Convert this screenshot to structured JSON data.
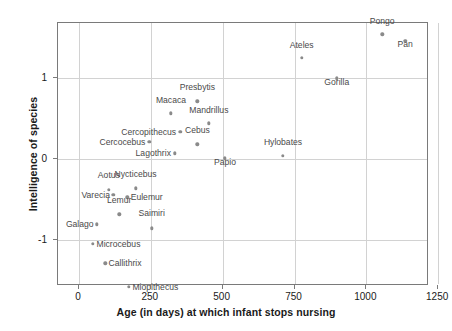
{
  "chart_data": {
    "type": "scatter",
    "title": "",
    "xlabel": "Age (in days) at which infant stops nursing",
    "ylabel": "Intelligence of species",
    "xlim": [
      -73,
      1218
    ],
    "ylim": [
      -1.56,
      1.67
    ],
    "xticks": [
      0,
      250,
      500,
      750,
      1000,
      1250
    ],
    "xticklabels": [
      "0",
      "250",
      "500",
      "750",
      "1000",
      "1250"
    ],
    "yticks": [
      -1,
      0,
      1
    ],
    "yticklabels": [
      "-1",
      "0",
      "1"
    ],
    "grid": true,
    "legend": "none",
    "point_color": "#8a8a8a",
    "label_color": "#4a4a4a",
    "grid_color": "#d2d2d2",
    "axis_color": "#7a7a7a",
    "points": [
      {
        "name": "Pongo",
        "x": 1055,
        "y": 1.53,
        "lx": 1055,
        "ly": 1.63,
        "pos": "above"
      },
      {
        "name": "Pan",
        "x": 1135,
        "y": 1.45,
        "lx": 1135,
        "ly": 1.35,
        "pos": "below"
      },
      {
        "name": "Ateles",
        "x": 775,
        "y": 1.24,
        "lx": 775,
        "ly": 1.34,
        "pos": "above"
      },
      {
        "name": "Gorilla",
        "x": 897,
        "y": 0.99,
        "lx": 897,
        "ly": 0.89,
        "pos": "below"
      },
      {
        "name": "Presbytis",
        "x": 412,
        "y": 0.71,
        "lx": 412,
        "ly": 0.82,
        "pos": "above"
      },
      {
        "name": "Macaca",
        "x": 320,
        "y": 0.56,
        "lx": 320,
        "ly": 0.66,
        "pos": "above"
      },
      {
        "name": "Mandrillus",
        "x": 452,
        "y": 0.44,
        "lx": 452,
        "ly": 0.54,
        "pos": "above"
      },
      {
        "name": "Cercopithecus",
        "x": 352,
        "y": 0.33,
        "lx": 338,
        "ly": 0.33,
        "pos": "left"
      },
      {
        "name": "Cercocebus",
        "x": 245,
        "y": 0.21,
        "lx": 231,
        "ly": 0.21,
        "pos": "left"
      },
      {
        "name": "Cebus",
        "x": 412,
        "y": 0.18,
        "lx": 412,
        "ly": 0.29,
        "pos": "above"
      },
      {
        "name": "Lagothrix",
        "x": 334,
        "y": 0.07,
        "lx": 320,
        "ly": 0.07,
        "pos": "left"
      },
      {
        "name": "Hylobates",
        "x": 710,
        "y": 0.04,
        "lx": 710,
        "ly": 0.15,
        "pos": "above"
      },
      {
        "name": "Papio",
        "x": 508,
        "y": 0.01,
        "lx": 508,
        "ly": -0.1,
        "pos": "below"
      },
      {
        "name": "Nycticebus",
        "x": 197,
        "y": -0.36,
        "lx": 197,
        "ly": -0.25,
        "pos": "above"
      },
      {
        "name": "Aotus",
        "x": 104,
        "y": -0.38,
        "lx": 104,
        "ly": -0.26,
        "pos": "above"
      },
      {
        "name": "Varecia",
        "x": 120,
        "y": -0.44,
        "lx": 108,
        "ly": -0.44,
        "pos": "left"
      },
      {
        "name": "Eulemur",
        "x": 168,
        "y": -0.47,
        "lx": 180,
        "ly": -0.47,
        "pos": "right"
      },
      {
        "name": "Lemur",
        "x": 140,
        "y": -0.68,
        "lx": 140,
        "ly": -0.57,
        "pos": "above"
      },
      {
        "name": "Galago",
        "x": 63,
        "y": -0.8,
        "lx": 51,
        "ly": -0.8,
        "pos": "left"
      },
      {
        "name": "Saimiri",
        "x": 253,
        "y": -0.85,
        "lx": 253,
        "ly": -0.73,
        "pos": "above"
      },
      {
        "name": "Microcebus",
        "x": 49,
        "y": -1.04,
        "lx": 61,
        "ly": -1.04,
        "pos": "right"
      },
      {
        "name": "Callithrix",
        "x": 91,
        "y": -1.28,
        "lx": 103,
        "ly": -1.28,
        "pos": "right"
      },
      {
        "name": "Miopithecus",
        "x": 174,
        "y": -1.57,
        "lx": 186,
        "ly": -1.57,
        "pos": "right"
      }
    ]
  }
}
